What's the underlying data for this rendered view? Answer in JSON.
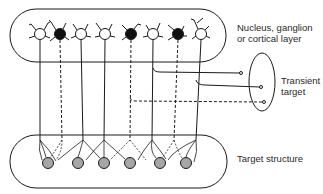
{
  "labels": {
    "top_layer_line1": "Nucleus, ganglion",
    "top_layer_line2": "or cortical layer",
    "transient_line1": "Transient",
    "transient_line2": "target",
    "target_structure": "Target structure"
  },
  "colors": {
    "stroke": "#1a1a1a",
    "filled_neuron": "#111111",
    "open_neuron": "#ffffff",
    "target_cell": "#a6a6a6"
  },
  "top_neurons": [
    {
      "x": 40,
      "type": "open"
    },
    {
      "x": 60,
      "type": "filled"
    },
    {
      "x": 81,
      "type": "open"
    },
    {
      "x": 105,
      "type": "open"
    },
    {
      "x": 131,
      "type": "filled"
    },
    {
      "x": 153,
      "type": "open"
    },
    {
      "x": 178,
      "type": "filled"
    },
    {
      "x": 201,
      "type": "open"
    }
  ],
  "target_cells": [
    47,
    78,
    104,
    130,
    160,
    186
  ]
}
